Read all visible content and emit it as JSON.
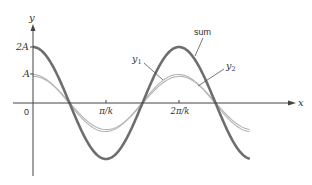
{
  "figure": {
    "axes": {
      "y_label": "y",
      "x_label": "x",
      "origin_label": "0",
      "y_ticks": [
        {
          "label": "2A",
          "value": 2
        },
        {
          "label": "A",
          "value": 1
        }
      ],
      "x_ticks": [
        {
          "label": "π/k",
          "value": 1
        },
        {
          "label": "2π/k",
          "value": 2
        }
      ]
    },
    "labels": {
      "sum": "sum",
      "y1": "y",
      "y1_sub": "1",
      "y2": "y",
      "y2_sub": "2"
    },
    "colors": {
      "axis": "#444444",
      "sum": "#6e6e6e",
      "component": "#b4b4b4",
      "text": "#333333"
    }
  },
  "chart_data": {
    "type": "line",
    "title": "",
    "xlabel": "x",
    "ylabel": "y",
    "x_units": "π/k",
    "y_units": "A",
    "xlim": [
      0,
      3
    ],
    "ylim": [
      -2,
      2
    ],
    "grid": false,
    "legend": "inline labels (sum, y1, y2)",
    "series": [
      {
        "name": "sum",
        "formula": "2A cos(kx)",
        "x": [
          0,
          0.5,
          1,
          1.5,
          2,
          2.5,
          2.97
        ],
        "values": [
          2,
          0,
          -2,
          0,
          2,
          0,
          -1.99
        ]
      },
      {
        "name": "y1",
        "formula": "A cos(kx)",
        "x": [
          0,
          0.5,
          1,
          1.5,
          2,
          2.5,
          2.97
        ],
        "values": [
          1,
          0,
          -1,
          0,
          1,
          0,
          -1
        ]
      },
      {
        "name": "y2",
        "formula": "A cos(kx) (nearly coincident with y1)",
        "x": [
          0,
          0.5,
          1,
          1.5,
          2,
          2.5,
          2.97
        ],
        "values": [
          0.95,
          0,
          -0.95,
          0,
          0.95,
          0,
          -0.95
        ]
      }
    ],
    "annotations": [
      "sum",
      "y1",
      "y2",
      "0",
      "A",
      "2A",
      "π/k",
      "2π/k"
    ]
  }
}
